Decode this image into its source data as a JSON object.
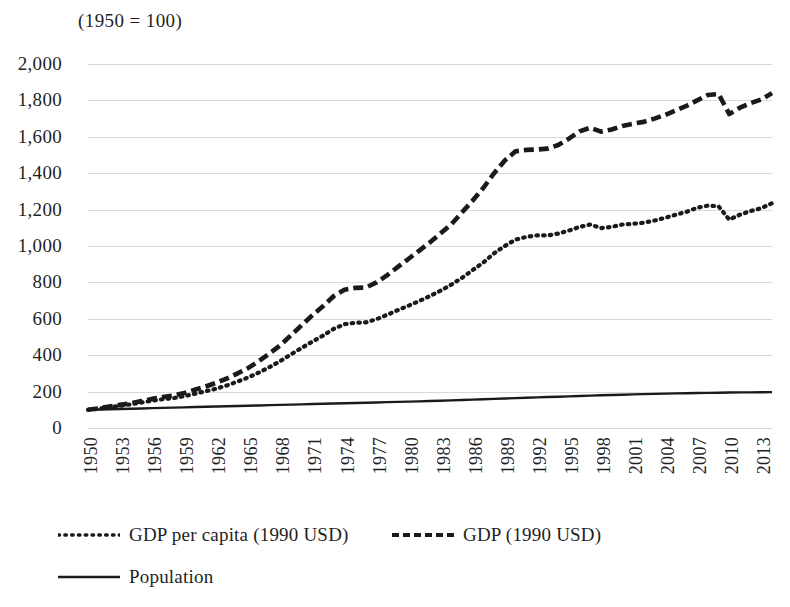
{
  "chart_data": {
    "type": "line",
    "title": "(1950 = 100)",
    "xlabel": "",
    "ylabel": "",
    "ylim": [
      0,
      2000
    ],
    "xlim": [
      1950,
      2014
    ],
    "grid": true,
    "legend_position": "bottom-left",
    "y_ticks": [
      "0",
      "200",
      "400",
      "600",
      "800",
      "1,000",
      "1,200",
      "1,400",
      "1,600",
      "1,800",
      "2,000"
    ],
    "y_tick_values": [
      0,
      200,
      400,
      600,
      800,
      1000,
      1200,
      1400,
      1600,
      1800,
      2000
    ],
    "x_tick_labels": [
      "1950",
      "1953",
      "1956",
      "1959",
      "1962",
      "1965",
      "1968",
      "1971",
      "1974",
      "1977",
      "1980",
      "1983",
      "1986",
      "1989",
      "1992",
      "1995",
      "1998",
      "2001",
      "2004",
      "2007",
      "2010",
      "2013"
    ],
    "x_tick_values": [
      1950,
      1953,
      1956,
      1959,
      1962,
      1965,
      1968,
      1971,
      1974,
      1977,
      1980,
      1983,
      1986,
      1989,
      1992,
      1995,
      1998,
      2001,
      2004,
      2007,
      2010,
      2013
    ],
    "x": [
      1950,
      1951,
      1952,
      1953,
      1954,
      1955,
      1956,
      1957,
      1958,
      1959,
      1960,
      1961,
      1962,
      1963,
      1964,
      1965,
      1966,
      1967,
      1968,
      1969,
      1970,
      1971,
      1972,
      1973,
      1974,
      1975,
      1976,
      1977,
      1978,
      1979,
      1980,
      1981,
      1982,
      1983,
      1984,
      1985,
      1986,
      1987,
      1988,
      1989,
      1990,
      1991,
      1992,
      1993,
      1994,
      1995,
      1996,
      1997,
      1998,
      1999,
      2000,
      2001,
      2002,
      2003,
      2004,
      2005,
      2006,
      2007,
      2008,
      2009,
      2010,
      2011,
      2012,
      2013,
      2014
    ],
    "series": [
      {
        "name": "GDP (1990 USD)",
        "style": "dashed",
        "color": "#1a1a1a",
        "values": [
          100,
          108,
          118,
          127,
          136,
          148,
          160,
          170,
          178,
          192,
          210,
          228,
          248,
          272,
          300,
          330,
          368,
          410,
          455,
          510,
          565,
          620,
          670,
          725,
          760,
          770,
          772,
          800,
          840,
          885,
          930,
          975,
          1020,
          1070,
          1120,
          1185,
          1250,
          1320,
          1400,
          1470,
          1520,
          1528,
          1530,
          1535,
          1555,
          1590,
          1630,
          1650,
          1628,
          1640,
          1660,
          1672,
          1682,
          1700,
          1720,
          1745,
          1770,
          1800,
          1830,
          1835,
          1725,
          1760,
          1785,
          1805,
          1840
        ]
      },
      {
        "name": "GDP per capita (1990 USD)",
        "style": "dotted",
        "color": "#1a1a1a",
        "values": [
          100,
          106,
          114,
          122,
          130,
          140,
          150,
          158,
          164,
          175,
          188,
          202,
          216,
          234,
          255,
          278,
          305,
          335,
          368,
          405,
          440,
          475,
          508,
          545,
          570,
          578,
          580,
          598,
          622,
          648,
          672,
          698,
          725,
          755,
          788,
          825,
          868,
          910,
          960,
          1000,
          1035,
          1050,
          1058,
          1058,
          1068,
          1085,
          1105,
          1118,
          1098,
          1105,
          1118,
          1122,
          1128,
          1140,
          1155,
          1172,
          1188,
          1210,
          1222,
          1218,
          1145,
          1172,
          1192,
          1208,
          1235
        ]
      },
      {
        "name": "Population",
        "style": "solid",
        "color": "#1a1a1a",
        "values": [
          100,
          101.5,
          103,
          104.5,
          106,
          107.5,
          109,
          110.5,
          112,
          113.5,
          115,
          116.5,
          118,
          119.5,
          121,
          122.5,
          124,
          125.5,
          127,
          128.5,
          130,
          131.5,
          133,
          134.5,
          136,
          137.5,
          139,
          140.5,
          142,
          143.5,
          145,
          146.5,
          148,
          150,
          152,
          154,
          156,
          158,
          160,
          162,
          164,
          166,
          168,
          170,
          172,
          174,
          176,
          178,
          180,
          181.5,
          183,
          184.5,
          186,
          187.5,
          189,
          190,
          191,
          192,
          193,
          194,
          194.8,
          195.5,
          196,
          196.5,
          197
        ]
      }
    ]
  },
  "legend": {
    "entries": [
      {
        "label": "GDP per capita (1990 USD)",
        "style": "dotted"
      },
      {
        "label": "GDP (1990 USD)",
        "style": "dashed"
      },
      {
        "label": "Population",
        "style": "solid"
      }
    ]
  },
  "colors": {
    "ink": "#1a1a1a",
    "gridline": "#d9d9d9",
    "background": "#ffffff"
  }
}
